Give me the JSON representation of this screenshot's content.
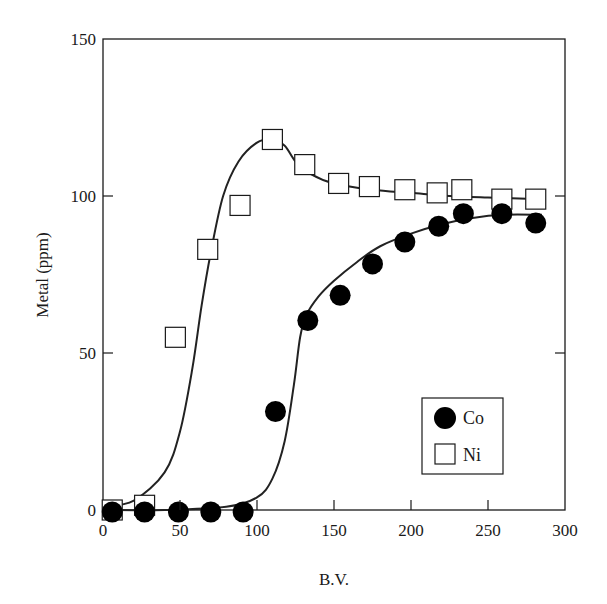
{
  "chart_data": {
    "type": "scatter",
    "title": "",
    "xlabel": "B.V.",
    "ylabel": "Metal (ppm)",
    "xlim": [
      0,
      300
    ],
    "ylim": [
      0,
      150
    ],
    "xticks": [
      0,
      50,
      100,
      150,
      200,
      250,
      300
    ],
    "yticks": [
      0,
      50,
      100,
      150
    ],
    "grid": false,
    "legend_position": "lower right (inside plot)",
    "series": [
      {
        "name": "Co",
        "marker": "filled-circle",
        "color": "#000000",
        "x": [
          6,
          27,
          49,
          70,
          91,
          112,
          133,
          154,
          175,
          196,
          218,
          234,
          259,
          281
        ],
        "y": [
          0,
          0,
          0,
          0,
          0,
          32,
          61,
          69,
          79,
          86,
          91,
          95,
          95,
          92
        ],
        "fit_curve": {
          "x": [
            0,
            40,
            80,
            100,
            110,
            118,
            124,
            128,
            132,
            140,
            150,
            165,
            180,
            200,
            220,
            240,
            260,
            285
          ],
          "y": [
            0,
            0,
            1,
            4,
            10,
            22,
            40,
            55,
            62,
            68,
            73,
            79,
            84,
            88,
            91,
            93,
            94,
            94
          ]
        }
      },
      {
        "name": "Ni",
        "marker": "open-square",
        "color": "#000000",
        "x": [
          6,
          27,
          47,
          68,
          89,
          110,
          131,
          153,
          173,
          196,
          217,
          233,
          259,
          281
        ],
        "y": [
          0,
          1.5,
          55,
          83,
          97,
          118,
          110,
          104,
          103,
          102,
          101,
          102,
          99,
          99
        ],
        "fit_curve": {
          "x": [
            0,
            20,
            40,
            50,
            58,
            64,
            70,
            78,
            88,
            100,
            110,
            118,
            125,
            135,
            150,
            175,
            200,
            225,
            250,
            285
          ],
          "y": [
            1,
            3,
            12,
            25,
            45,
            65,
            82,
            100,
            111,
            117,
            118,
            116,
            111,
            107,
            104,
            102,
            101,
            100,
            99.5,
            99
          ]
        }
      }
    ],
    "legend": [
      {
        "label": "Co",
        "marker": "filled-circle"
      },
      {
        "label": "Ni",
        "marker": "open-square"
      }
    ]
  }
}
